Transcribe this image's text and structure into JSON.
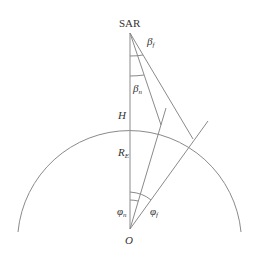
{
  "diagram": {
    "labels": {
      "sar": "SAR",
      "beta_f": "β",
      "beta_f_sub": "f",
      "beta_n": "β",
      "beta_n_sub": "n",
      "height": "H",
      "radius": "R",
      "radius_sub": "E",
      "phi_n": "φ",
      "phi_n_sub": "n",
      "phi_f": "φ",
      "phi_f_sub": "f",
      "origin": "O"
    },
    "colors": {
      "line": "#888888",
      "text": "#333333"
    }
  }
}
